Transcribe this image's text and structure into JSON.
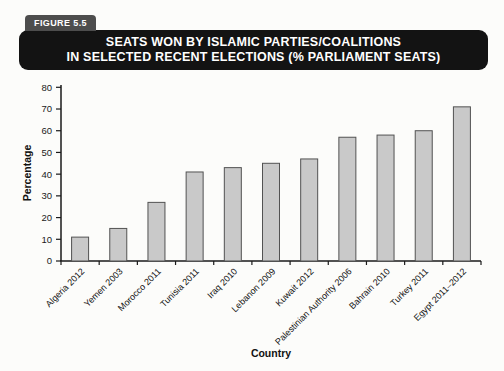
{
  "figure_label": "FIGURE 5.5",
  "title_line1": "SEATS WON BY ISLAMIC PARTIES/COALITIONS",
  "title_line2": "IN SELECTED RECENT ELECTIONS (% PARLIAMENT SEATS)",
  "chart_data": {
    "type": "bar",
    "title": "Seats Won by Islamic Parties/Coalitions in Selected Recent Elections (% Parliament Seats)",
    "categories": [
      "Algeria 2012",
      "Yemen 2003",
      "Morocco 2011",
      "Tunisia 2011",
      "Iraq 2010",
      "Lebanon 2009",
      "Kuwait 2012",
      "Palestinian Authority 2006",
      "Bahrain 2010",
      "Turkey 2011",
      "Egypt 2011–2012"
    ],
    "values": [
      11,
      15,
      27,
      41,
      43,
      45,
      47,
      57,
      58,
      60,
      71
    ],
    "xlabel": "Country",
    "ylabel": "Percentage",
    "ylim": [
      0,
      80
    ],
    "ytick_step": 10,
    "grid": false,
    "legend": "none",
    "bar_fill": "#c9c9c9",
    "bar_stroke": "#525252"
  },
  "colors": {
    "page_bg": "#fcfcfa",
    "title_box_bg": "#131313",
    "figure_tab_bg": "#4d4d4d",
    "title_text": "#ffffff",
    "axis": "#1a1a1a",
    "text": "#111111"
  }
}
